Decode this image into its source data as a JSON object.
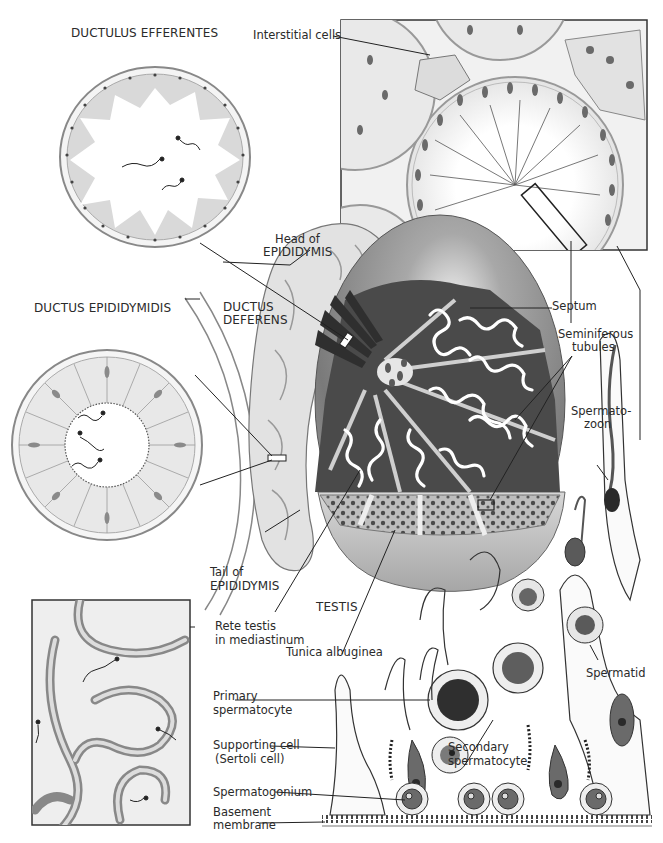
{
  "diagram": {
    "colors": {
      "background": "#ffffff",
      "line": "#2a2a2a",
      "testis_surface": "#9a9a9a",
      "lobule_dark": "#4a4a4a",
      "tubule_white": "#ffffff",
      "epididymis_light": "#d6d6d6",
      "cell_fill": "#e6e6e6",
      "nucleus": "#555555"
    },
    "section_titles": {
      "ductulus_efferentes": "DUCTULUS EFFERENTES",
      "ductus_epididymidis": "DUCTUS EPIDIDYMIDIS",
      "ductus_deferens_line1": "DUCTUS",
      "ductus_deferens_line2": "DEFERENS",
      "testis": "TESTIS"
    },
    "labels": {
      "interstitial_cells": "Interstitial cells",
      "head_of_epididymis_line1": "Head of",
      "head_of_epididymis_line2": "EPIDIDYMIS",
      "septum": "Septum",
      "seminiferous_tubules_line1": "Seminiferous",
      "seminiferous_tubules_line2": "tubules",
      "spermatozoon_line1": "Spermato-",
      "spermatozoon_line2": "zoon",
      "tail_of_epididymis_line1": "Tail of",
      "tail_of_epididymis_line2": "EPIDIDYMIS",
      "rete_testis_line1": "Rete testis",
      "rete_testis_line2": "in mediastinum",
      "tunica_albuginea": "Tunica albuginea",
      "spermatid": "Spermatid",
      "primary_spermatocyte_line1": "Primary",
      "primary_spermatocyte_line2": "spermatocyte",
      "secondary_spermatocyte_line1": "Secondary",
      "secondary_spermatocyte_line2": "spermatocyte",
      "supporting_cell_line1": "Supporting cell",
      "supporting_cell_line2": "(Sertoli cell)",
      "spermatogonium": "Spermatogonium",
      "basement_membrane_line1": "Basement",
      "basement_membrane_line2": "membrane"
    }
  }
}
